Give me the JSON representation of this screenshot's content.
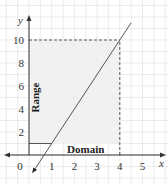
{
  "chart_data": {
    "type": "line",
    "title": "",
    "xlabel": "x",
    "ylabel": "y",
    "xlim": [
      -0.9,
      5.9
    ],
    "ylim": [
      -2.2,
      12.5
    ],
    "grid": true,
    "x_ticks": [
      0,
      1,
      2,
      3,
      4,
      5
    ],
    "x_tick_labels": [
      "0",
      "1",
      "2",
      "3",
      "4",
      "5"
    ],
    "y_ticks": [
      2,
      4,
      6,
      8,
      10
    ],
    "y_tick_labels": [
      "2",
      "4",
      "6",
      "8",
      "10"
    ],
    "series": [
      {
        "name": "y = 3x - 2",
        "x": [
          0.15,
          4.5
        ],
        "y": [
          -1.55,
          11.5
        ]
      }
    ],
    "shaded_region": {
      "x": [
        0,
        4
      ],
      "y": [
        1,
        10
      ]
    },
    "guide_lines": [
      {
        "from": [
          0,
          10
        ],
        "to": [
          4,
          10
        ],
        "style": "dashed"
      },
      {
        "from": [
          4,
          0
        ],
        "to": [
          4,
          10
        ],
        "style": "dashed"
      },
      {
        "from": [
          0,
          1
        ],
        "to": [
          1,
          1
        ],
        "style": "solid"
      }
    ],
    "annotations": [
      {
        "text": "Range",
        "orientation": "vertical",
        "at": [
          0.3,
          5
        ]
      },
      {
        "text": "Domain",
        "orientation": "horizontal",
        "at": [
          2.5,
          0.55
        ]
      }
    ],
    "colors": {
      "line": "#555555",
      "shade": "#eeeeee",
      "grid": "#e4e4e4",
      "axis": "#333333"
    }
  }
}
